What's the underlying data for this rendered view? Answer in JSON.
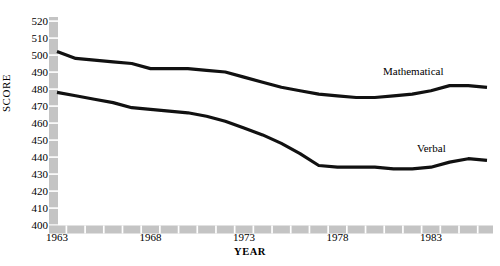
{
  "chart_data": {
    "type": "line",
    "title": "",
    "xlabel": "YEAR",
    "ylabel": "SCORE",
    "xlim": [
      1963,
      1986
    ],
    "ylim": [
      400,
      520
    ],
    "grid": false,
    "legend_position": "inline-annotation",
    "x": [
      1963,
      1964,
      1965,
      1966,
      1967,
      1968,
      1969,
      1970,
      1971,
      1972,
      1973,
      1974,
      1975,
      1976,
      1977,
      1978,
      1979,
      1980,
      1981,
      1982,
      1983,
      1984,
      1985,
      1986
    ],
    "xtick_values": [
      1963,
      1968,
      1973,
      1978,
      1983
    ],
    "xtick_labels": [
      "1963",
      "1968",
      "1973",
      "1978",
      "1983"
    ],
    "ytick_values": [
      400,
      410,
      420,
      430,
      440,
      450,
      460,
      470,
      480,
      490,
      500,
      510,
      520
    ],
    "ytick_labels": [
      "400",
      "410",
      "420",
      "430",
      "440",
      "450",
      "460",
      "470",
      "480",
      "490",
      "500",
      "510",
      "520"
    ],
    "series": [
      {
        "name": "Mathematical",
        "label": "Mathematical",
        "color": "#111111",
        "values": [
          502,
          498,
          497,
          496,
          495,
          492,
          492,
          492,
          491,
          490,
          487,
          484,
          481,
          479,
          477,
          476,
          475,
          475,
          476,
          477,
          479,
          482,
          482,
          481
        ]
      },
      {
        "name": "Verbal",
        "label": "Verbal",
        "color": "#111111",
        "values": [
          478,
          476,
          474,
          472,
          469,
          468,
          467,
          466,
          464,
          461,
          457,
          453,
          448,
          442,
          435,
          434,
          434,
          434,
          433,
          433,
          434,
          437,
          439,
          438
        ]
      }
    ]
  },
  "axis_style": {
    "axis_bar_color": "#c4c4c4",
    "tick_gap_color": "#ffffff",
    "line_color": "#111111"
  },
  "annotations": {
    "mathematical": "Mathematical",
    "verbal": "Verbal"
  }
}
